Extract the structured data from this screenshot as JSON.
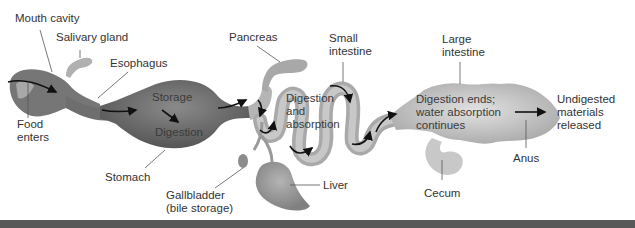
{
  "diagram": {
    "labels": {
      "mouth_cavity": "Mouth cavity",
      "salivary_gland": "Salivary gland",
      "esophagus": "Esophagus",
      "food_enters_1": "Food",
      "food_enters_2": "enters",
      "stomach": "Stomach",
      "storage": "Storage",
      "digestion": "Digestion",
      "pancreas": "Pancreas",
      "gallbladder_1": "Gallbladder",
      "gallbladder_2": "(bile storage)",
      "liver": "Liver",
      "small_intestine_1": "Small",
      "small_intestine_2": "intestine",
      "digestion_absorption_1": "Digestion",
      "digestion_absorption_2": "and",
      "digestion_absorption_3": "absorption",
      "large_intestine_1": "Large",
      "large_intestine_2": "intestine",
      "large_inner_1": "Digestion ends;",
      "large_inner_2": "water absorption",
      "large_inner_3": "continues",
      "cecum": "Cecum",
      "anus": "Anus",
      "undigested_1": "Undigested",
      "undigested_2": "materials",
      "undigested_3": "released"
    },
    "colors": {
      "stomach": "#6e6e6e",
      "mouth": "#7a7a7a",
      "intestine": "#b5b5b5",
      "large_intestine": "#c4c4c4",
      "liver": "#9a9a9a",
      "pancreas": "#a8a8a8",
      "bottom_bar": "#585858"
    }
  }
}
